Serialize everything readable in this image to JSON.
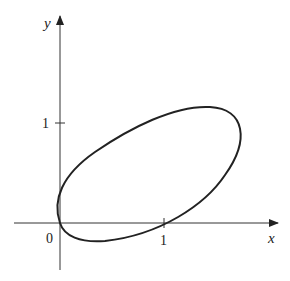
{
  "figure": {
    "x_axis_label": "x",
    "y_axis_label": "y",
    "origin_label": "0",
    "x_tick_label": "1",
    "y_tick_label": "1",
    "curve": "closed elliptical curve through origin, tilted, passing through (1,0)",
    "stroke_color": "#222222"
  }
}
